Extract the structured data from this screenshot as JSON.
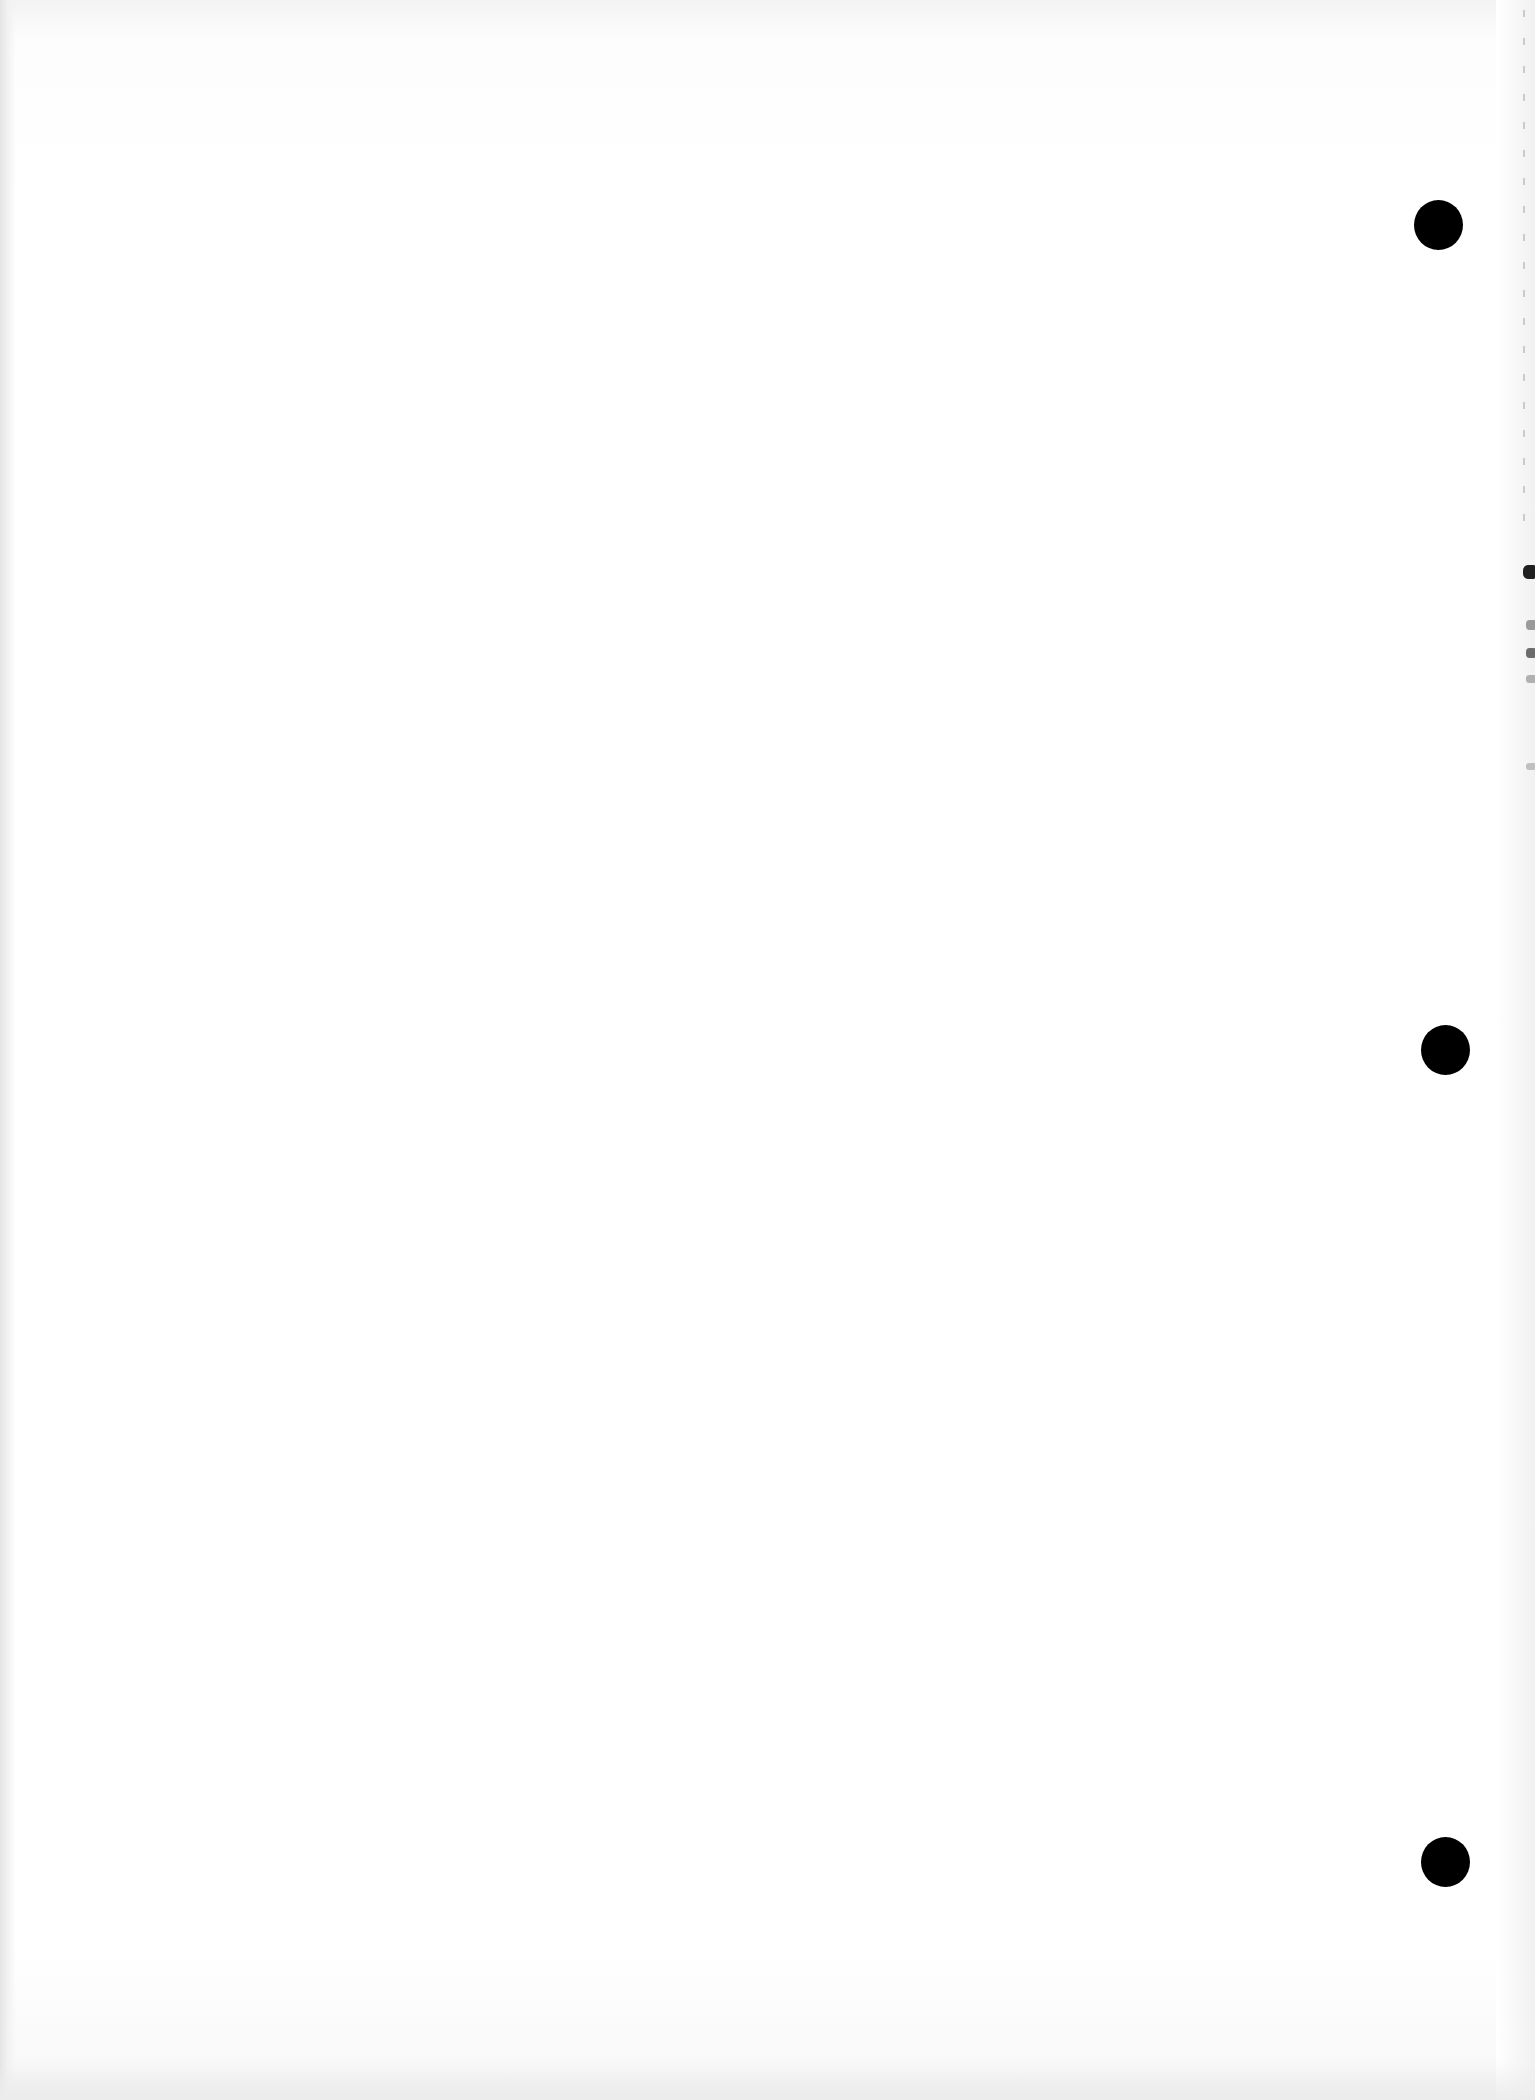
{
  "document": {
    "type": "scanned-blank-page",
    "text_content": "",
    "background_color": "#ffffff",
    "punch_holes": [
      {
        "position": "top",
        "color": "#000000"
      },
      {
        "position": "middle",
        "color": "#000000"
      },
      {
        "position": "bottom",
        "color": "#000000"
      }
    ],
    "right_edge": {
      "perforation": true
    }
  }
}
